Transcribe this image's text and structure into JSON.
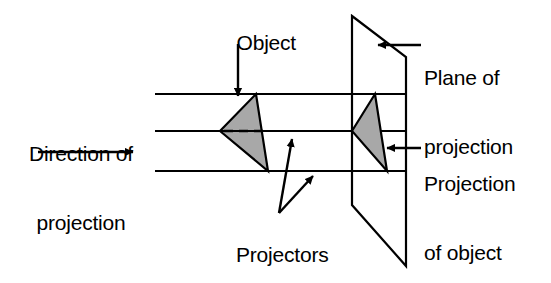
{
  "diagram": {
    "type": "technical-line-drawing",
    "background_color": "#ffffff",
    "line_color": "#000000",
    "object_fill_color": "#a8a8a8",
    "labels": {
      "object": "Object",
      "direction_of_projection_line1": "Direction of",
      "direction_of_projection_line2": "projection",
      "plane_of_projection_line1": "Plane of",
      "plane_of_projection_line2": "projection",
      "projection_of_object_line1": "Projection",
      "projection_of_object_line2": "of object",
      "projectors": "Projectors"
    },
    "icons": {
      "direction_arrow": "arrow-right-icon",
      "object_pointer": "arrow-down-icon",
      "plane_pointer": "arrow-left-icon",
      "projection_pointer": "arrow-left-icon",
      "projector_pointer_upper": "arrow-up-right-icon",
      "projector_pointer_lower": "arrow-up-right-icon"
    },
    "geometry": {
      "projector_lines_y": [
        94,
        131,
        171
      ],
      "projector_lines_x_start": 155,
      "projector_lines_x_end": 406,
      "object_triangle": "220,131 256,94 268,171",
      "projection_triangle": "352,131 375,94 387,171",
      "plane_corners": "352,16 406,57 406,266 352,205",
      "hidden_edge_y": 131,
      "hidden_edge_x_start": 224,
      "hidden_edge_x_end": 268
    }
  }
}
